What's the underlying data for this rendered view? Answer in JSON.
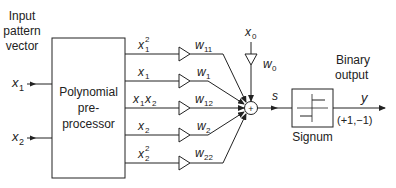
{
  "title_labels": {
    "input_line1": "Input",
    "input_line2": "pattern",
    "input_line3": "vector",
    "output_line1": "Binary",
    "output_line2": "output"
  },
  "inputs": [
    {
      "var": "x",
      "sub": "1"
    },
    {
      "var": "x",
      "sub": "2"
    }
  ],
  "preprocessor": {
    "line1": "Polynomial",
    "line2": "pre-",
    "line3": "processor"
  },
  "terms": [
    {
      "label_main": "x",
      "label_sub": "1",
      "label_sup": "2",
      "weight": "w",
      "weight_sub": "11"
    },
    {
      "label_main": "x",
      "label_sub": "1",
      "label_sup": "",
      "weight": "w",
      "weight_sub": "1"
    },
    {
      "label_main": "x",
      "label_sub": "1",
      "label_main2": "x",
      "label_sub2": "2",
      "weight": "w",
      "weight_sub": "12"
    },
    {
      "label_main": "x",
      "label_sub": "2",
      "label_sup": "",
      "weight": "w",
      "weight_sub": "2"
    },
    {
      "label_main": "x",
      "label_sub": "2",
      "label_sup": "2",
      "weight": "w",
      "weight_sub": "22"
    }
  ],
  "bias": {
    "var": "x",
    "sub": "0",
    "weight": "w",
    "weight_sub": "0"
  },
  "summer": {
    "symbol": "+"
  },
  "signal": {
    "s": "s"
  },
  "signum": {
    "label": "Signum"
  },
  "output": {
    "var": "y",
    "range": "(+1,−1)"
  }
}
